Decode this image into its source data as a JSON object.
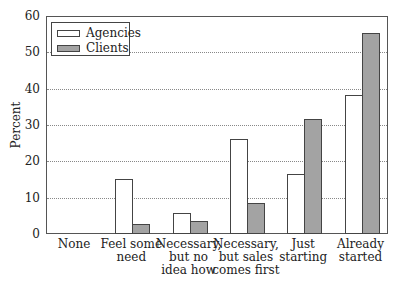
{
  "chart_data": {
    "type": "bar",
    "title": "",
    "xlabel": "",
    "ylabel": "Percent",
    "ylim": [
      0,
      60
    ],
    "yticks": [
      0,
      10,
      20,
      30,
      40,
      50,
      60
    ],
    "grid": "horizontal dotted",
    "legend_position": "upper left",
    "categories": [
      "None",
      "Feel some need",
      "Necessary, but no idea how",
      "Necessary, but sales comes first",
      "Just starting",
      "Already started"
    ],
    "category_lines": [
      [
        "None"
      ],
      [
        "Feel some",
        "need"
      ],
      [
        "Necessary,",
        "but no",
        "idea how"
      ],
      [
        "Necessary,",
        "but sales",
        "comes first"
      ],
      [
        "Just",
        "starting"
      ],
      [
        "Already",
        "started"
      ]
    ],
    "series": [
      {
        "name": "Agencies",
        "color": "#ffffff",
        "values": [
          0,
          15,
          5.5,
          26,
          16.3,
          38
        ]
      },
      {
        "name": "Clients",
        "color": "#a3a3a3",
        "values": [
          0,
          2.5,
          3.3,
          8.3,
          31.3,
          55
        ]
      }
    ]
  },
  "legend": {
    "agencies_label": "Agencies",
    "clients_label": "Clients"
  }
}
